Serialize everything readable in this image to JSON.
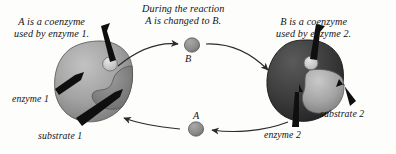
{
  "figure": {
    "background_color": "#fdfdfc",
    "ink_color": "#141414"
  },
  "captions": {
    "left": {
      "line1": "A is a coenzyme",
      "line2": "used by enzyme 1."
    },
    "center": {
      "line1": "During the reaction",
      "line2": "A is changed to B."
    },
    "right": {
      "line1": "B is a coenzyme",
      "line2": "used by enzyme 2."
    }
  },
  "labels": {
    "enzyme1": "enzyme 1",
    "substrate1": "substrate 1",
    "enzyme2": "enzyme 2",
    "substrate2": "substrate 2"
  },
  "molecules": [
    {
      "id": "B",
      "label": "B",
      "position": "top-center",
      "fill": "#8d8d8d"
    },
    {
      "id": "A",
      "label": "A",
      "position": "bottom-center",
      "fill": "#8d8d8d"
    }
  ],
  "enzymes": [
    {
      "id": "enzyme-1",
      "label": "enzyme 1",
      "position": "left",
      "body_fill": "#9a9a9a",
      "substrate_fill": "#7e7e7e",
      "coenzyme_fill": "#d8d8d8"
    },
    {
      "id": "enzyme-2",
      "label": "enzyme 2",
      "position": "right",
      "body_fill": "#3a3a3a",
      "substrate_fill": "#a6a6a6",
      "coenzyme_fill": "#d6d6d6"
    }
  ],
  "flow_arrows": [
    {
      "id": "arrow-enzyme1-to-B",
      "from": "enzyme 1",
      "to": "B",
      "direction": "right"
    },
    {
      "id": "arrow-B-to-enzyme2",
      "from": "B",
      "to": "enzyme 2",
      "direction": "right"
    },
    {
      "id": "arrow-enzyme2-to-A",
      "from": "enzyme 2",
      "to": "A",
      "direction": "left"
    },
    {
      "id": "arrow-A-to-enzyme1",
      "from": "A",
      "to": "enzyme 1",
      "direction": "left"
    }
  ],
  "pointer_arrows": [
    {
      "id": "pointer-enzyme-1",
      "target": "enzyme 1"
    },
    {
      "id": "pointer-substrate-1",
      "target": "substrate 1"
    },
    {
      "id": "pointer-coenzyme-1",
      "target": "coenzyme on enzyme 1"
    },
    {
      "id": "pointer-enzyme-2",
      "target": "enzyme 2"
    },
    {
      "id": "pointer-substrate-2",
      "target": "substrate 2"
    },
    {
      "id": "pointer-coenzyme-2",
      "target": "coenzyme on enzyme 2"
    }
  ]
}
